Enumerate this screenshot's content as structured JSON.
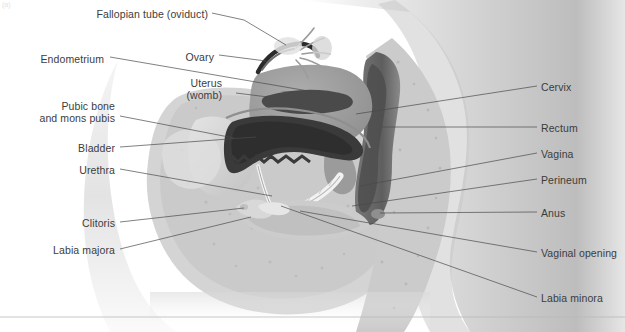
{
  "figure": {
    "type": "anatomical-diagram",
    "corner_mark": "(a)",
    "divider_present": true
  },
  "labels_left": [
    {
      "id": "fallopian-tube",
      "text": "Fallopian tube (oviduct)",
      "x": 208,
      "y": 15,
      "tip_x": 287,
      "tip_y": 45
    },
    {
      "id": "endometrium",
      "text": "Endometrium",
      "x": 104,
      "y": 60,
      "tip_x": 318,
      "tip_y": 94
    },
    {
      "id": "ovary",
      "text": "Ovary",
      "x": 214,
      "y": 58,
      "tip_x": 265,
      "tip_y": 62
    },
    {
      "id": "uterus",
      "text": "Uterus\n(womb)",
      "x": 222,
      "y": 90,
      "tip_x": 266,
      "tip_y": 97
    },
    {
      "id": "pubic-bone",
      "text": "Pubic bone\nand mons pubis",
      "x": 115,
      "y": 113,
      "tip_x": 233,
      "tip_y": 137
    },
    {
      "id": "bladder",
      "text": "Bladder",
      "x": 115,
      "y": 149,
      "tip_x": 255,
      "tip_y": 137
    },
    {
      "id": "urethra",
      "text": "Urethra",
      "x": 115,
      "y": 171,
      "tip_x": 272,
      "tip_y": 196
    },
    {
      "id": "clitoris",
      "text": "Clitoris",
      "x": 115,
      "y": 224,
      "tip_x": 243,
      "tip_y": 208
    },
    {
      "id": "labia-majora",
      "text": "Labia majora",
      "x": 115,
      "y": 251,
      "tip_x": 250,
      "tip_y": 218
    }
  ],
  "labels_right": [
    {
      "id": "cervix",
      "text": "Cervix",
      "x": 541,
      "y": 88,
      "tip_x": 356,
      "tip_y": 114
    },
    {
      "id": "rectum",
      "text": "Rectum",
      "x": 541,
      "y": 129,
      "tip_x": 381,
      "tip_y": 127
    },
    {
      "id": "vagina",
      "text": "Vagina",
      "x": 541,
      "y": 155,
      "tip_x": 360,
      "tip_y": 186
    },
    {
      "id": "perineum",
      "text": "Perineum",
      "x": 541,
      "y": 181,
      "tip_x": 352,
      "tip_y": 206
    },
    {
      "id": "anus",
      "text": "Anus",
      "x": 541,
      "y": 214,
      "tip_x": 380,
      "tip_y": 213
    },
    {
      "id": "vaginal-opening",
      "text": "Vaginal opening",
      "x": 541,
      "y": 254,
      "tip_x": 300,
      "tip_y": 211
    },
    {
      "id": "labia-minora",
      "text": "Labia minora",
      "x": 541,
      "y": 299,
      "tip_x": 281,
      "tip_y": 205
    }
  ],
  "palette": {
    "background": "#ffffff",
    "text": "#3c3c3c",
    "leader_line": "#4a4a4a",
    "divider": "#b9b9b9",
    "skin_light": "#e9e9e9",
    "skin_mid": "#cfcfcf",
    "skin_dark": "#a9a9a9",
    "organ_grey": "#9a9a9a",
    "cavity_dark": "#3b3b3b",
    "bone_pale": "#dcdcdc"
  }
}
